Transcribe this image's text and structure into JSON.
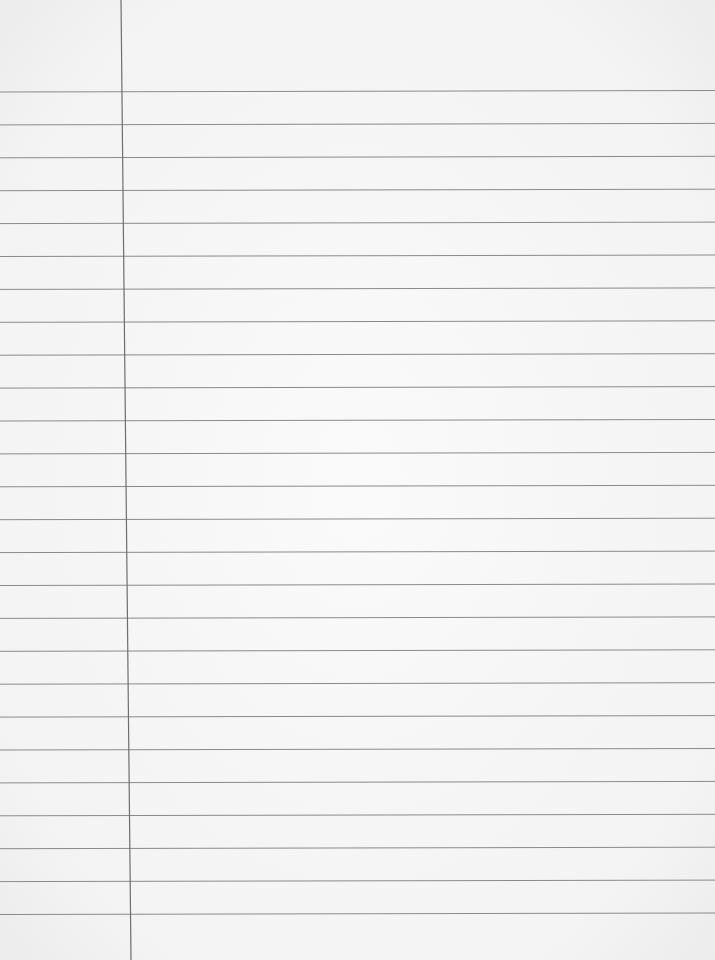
{
  "page": {
    "type": "lined notebook paper",
    "background_color": "#f4f4f4",
    "rule_color": "#8a8a8a",
    "margin_color": "#6e6e6e",
    "rule_count": 26,
    "first_rule_y": 92,
    "rule_spacing": 32.9,
    "margin_x_top": 121,
    "margin_x_bottom": 131,
    "text": []
  }
}
